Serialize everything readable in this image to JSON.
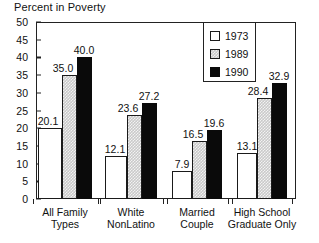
{
  "chart_data": {
    "type": "bar",
    "title": "Percent in Poverty",
    "xlabel": "",
    "ylabel": "",
    "ylim": [
      0,
      50
    ],
    "ytick_step": 5,
    "yticks": [
      "50",
      "45",
      "40",
      "35",
      "30",
      "25",
      "20",
      "15",
      "10",
      "5",
      "0"
    ],
    "grid": false,
    "legend_position": "top-right-inset",
    "categories": [
      [
        "All Family",
        "Types"
      ],
      [
        "White",
        "NonLatino"
      ],
      [
        "Married",
        "Couple"
      ],
      [
        "High School",
        "Graduate Only"
      ]
    ],
    "series": [
      {
        "name": "1973",
        "fill": "white",
        "values": [
          20.1,
          12.1,
          7.9,
          13.1
        ],
        "labels": [
          "20.1",
          "12.1",
          "7.9",
          "13.1"
        ]
      },
      {
        "name": "1989",
        "fill": "gray",
        "values": [
          35.0,
          23.6,
          16.5,
          28.4
        ],
        "labels": [
          "35.0",
          "23.6",
          "16.5",
          "28.4"
        ]
      },
      {
        "name": "1990",
        "fill": "black",
        "values": [
          40.0,
          27.2,
          19.6,
          32.9
        ],
        "labels": [
          "40.0",
          "27.2",
          "19.6",
          "32.9"
        ]
      }
    ],
    "colors": {
      "series_1973": "#ffffff",
      "series_1989": "#c9c9c9",
      "series_1990": "#0a0a0a",
      "axis": "#222222",
      "text": "#111111",
      "background": "#ffffff"
    }
  },
  "legend": {
    "items": [
      {
        "label": "1973",
        "fill": "white"
      },
      {
        "label": "1989",
        "fill": "gray"
      },
      {
        "label": "1990",
        "fill": "black"
      }
    ]
  }
}
